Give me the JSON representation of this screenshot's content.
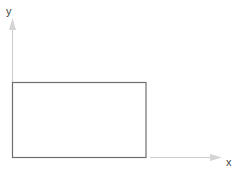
{
  "diagram": {
    "axes": {
      "y_label": "y",
      "x_label": "x",
      "axis_color": "#c8c8c8"
    },
    "rectangle": {
      "stroke_color": "#6e6e6e",
      "fill": "#ffffff"
    }
  }
}
